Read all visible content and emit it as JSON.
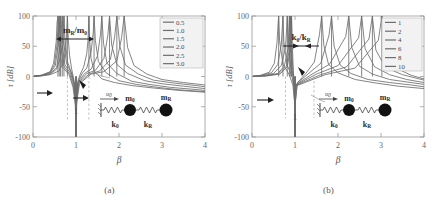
{
  "figure": {
    "panels": [
      {
        "caption": "(a)",
        "annotation": "mR/m0",
        "annotation_parts": {
          "num": "m",
          "num_sub": "R",
          "den": "m",
          "den_sub": "0",
          "slash": "/"
        },
        "one_marker": "1",
        "legend_title": "",
        "legend_entries": [
          "0.5",
          "1.0",
          "1.5",
          "2.0",
          "2.5",
          "3.0"
        ],
        "diagram": {
          "u0": "u",
          "u0_sub": "0",
          "mass_left": "m",
          "mass_left_sub": "0",
          "mass_right": "m",
          "mass_right_sub": "R",
          "spring_left": "k",
          "spring_left_sub": "0",
          "spring_right": "k",
          "spring_right_sub": "R"
        }
      },
      {
        "caption": "(b)",
        "annotation": "k0/kR",
        "annotation_parts": {
          "num": "k",
          "num_sub": "0",
          "den": "k",
          "den_sub": "R",
          "slash": "/"
        },
        "one_marker": "1",
        "legend_title": "",
        "legend_entries": [
          "1",
          "2",
          "4",
          "6",
          "8",
          "10"
        ],
        "diagram": {
          "u0": "u",
          "u0_sub": "0",
          "mass_left": "m",
          "mass_left_sub": "0",
          "mass_right": "m",
          "mass_right_sub": "R",
          "spring_left": "k",
          "spring_left_sub": "0",
          "spring_right": "k",
          "spring_right_sub": "R"
        }
      }
    ]
  },
  "chart_data": [
    {
      "type": "line",
      "title": "(a)",
      "xlabel": "β",
      "ylabel": "τ [dB]",
      "xlim": [
        0,
        4
      ],
      "ylim": [
        -100,
        100
      ],
      "xticks": [
        0,
        1,
        2,
        3,
        4
      ],
      "yticks": [
        -100,
        -50,
        0,
        50,
        100
      ],
      "xtick_labels": [
        "0",
        "1",
        "2",
        "3",
        "4"
      ],
      "ytick_labels": [
        "-100",
        "-50",
        "0",
        "50",
        "100"
      ],
      "grid": false,
      "legend_position": "upper-right",
      "legend_parameter": "mR/m0",
      "series": [
        {
          "name": "0.5",
          "color": "#6e6e6e",
          "resonances": [
            0.8,
            1.3
          ],
          "antiresonance": 1.0,
          "x": [
            0.02,
            0.2,
            0.4,
            0.6,
            0.7,
            0.75,
            0.78,
            0.8,
            0.82,
            0.85,
            0.9,
            0.95,
            0.98,
            1.0,
            1.02,
            1.05,
            1.1,
            1.18,
            1.25,
            1.28,
            1.3,
            1.32,
            1.35,
            1.42,
            1.6,
            1.9,
            2.3,
            2.8,
            3.4,
            4.0
          ],
          "y": [
            0.2,
            1.0,
            3.0,
            9.0,
            22.0,
            40.0,
            65.0,
            100.0,
            62.0,
            35.0,
            12.0,
            -5.0,
            -25.0,
            -100.0,
            -24.0,
            -6.0,
            4.0,
            16.0,
            38.0,
            60.0,
            100.0,
            58.0,
            30.0,
            9.0,
            -4.0,
            -10.0,
            -15.0,
            -19.0,
            -23.0,
            -26.0
          ]
        },
        {
          "name": "1.0",
          "color": "#6e6e6e",
          "resonances": [
            0.72,
            1.42
          ],
          "antiresonance": 1.0,
          "x": [
            0.02,
            0.2,
            0.4,
            0.55,
            0.65,
            0.7,
            0.72,
            0.74,
            0.8,
            0.9,
            0.95,
            0.98,
            1.0,
            1.02,
            1.05,
            1.15,
            1.25,
            1.35,
            1.4,
            1.42,
            1.45,
            1.52,
            1.7,
            2.0,
            2.4,
            2.9,
            3.4,
            4.0
          ],
          "y": [
            0.3,
            1.2,
            4.0,
            12.0,
            35.0,
            70.0,
            100.0,
            66.0,
            25.0,
            5.0,
            -8.0,
            -28.0,
            -100.0,
            -27.0,
            -8.0,
            6.0,
            14.0,
            40.0,
            72.0,
            100.0,
            60.0,
            25.0,
            6.0,
            -7.0,
            -13.0,
            -18.0,
            -22.0,
            -25.0
          ]
        },
        {
          "name": "1.5",
          "color": "#6e6e6e",
          "resonances": [
            0.68,
            1.6
          ],
          "antiresonance": 1.0,
          "x": [
            0.02,
            0.2,
            0.4,
            0.55,
            0.62,
            0.66,
            0.68,
            0.7,
            0.78,
            0.9,
            0.96,
            0.99,
            1.0,
            1.01,
            1.05,
            1.2,
            1.35,
            1.5,
            1.57,
            1.6,
            1.64,
            1.72,
            1.95,
            2.3,
            2.7,
            3.2,
            3.7,
            4.0
          ],
          "y": [
            0.4,
            1.5,
            5.0,
            15.0,
            45.0,
            80.0,
            100.0,
            62.0,
            22.0,
            4.0,
            -12.0,
            -35.0,
            -100.0,
            -34.0,
            -9.0,
            5.0,
            12.0,
            34.0,
            70.0,
            100.0,
            55.0,
            22.0,
            5.0,
            -8.0,
            -13.0,
            -18.0,
            -21.0,
            -23.0
          ]
        },
        {
          "name": "2.0",
          "color": "#6e6e6e",
          "resonances": [
            0.64,
            1.78
          ],
          "antiresonance": 1.0,
          "x": [
            0.02,
            0.2,
            0.4,
            0.52,
            0.58,
            0.62,
            0.64,
            0.66,
            0.74,
            0.88,
            0.95,
            0.99,
            1.0,
            1.01,
            1.06,
            1.25,
            1.45,
            1.65,
            1.74,
            1.78,
            1.83,
            1.95,
            2.2,
            2.6,
            3.0,
            3.5,
            4.0
          ],
          "y": [
            0.5,
            1.8,
            6.0,
            18.0,
            50.0,
            85.0,
            100.0,
            60.0,
            20.0,
            4.0,
            -14.0,
            -40.0,
            -100.0,
            -38.0,
            -10.0,
            5.0,
            10.0,
            30.0,
            68.0,
            100.0,
            52.0,
            20.0,
            5.0,
            -7.0,
            -12.0,
            -16.0,
            -20.0
          ]
        },
        {
          "name": "2.5",
          "color": "#6e6e6e",
          "resonances": [
            0.61,
            1.95
          ],
          "antiresonance": 1.0,
          "x": [
            0.02,
            0.2,
            0.4,
            0.5,
            0.56,
            0.59,
            0.61,
            0.63,
            0.71,
            0.86,
            0.94,
            0.99,
            1.0,
            1.01,
            1.07,
            1.3,
            1.55,
            1.8,
            1.9,
            1.95,
            2.02,
            2.15,
            2.45,
            2.8,
            3.3,
            3.8,
            4.0
          ],
          "y": [
            0.6,
            2.0,
            7.0,
            20.0,
            54.0,
            88.0,
            100.0,
            58.0,
            18.0,
            3.0,
            -16.0,
            -44.0,
            -100.0,
            -42.0,
            -11.0,
            4.0,
            9.0,
            28.0,
            66.0,
            100.0,
            50.0,
            19.0,
            4.0,
            -6.0,
            -11.0,
            -15.0,
            -17.0
          ]
        },
        {
          "name": "3.0",
          "color": "#6e6e6e",
          "resonances": [
            0.58,
            2.12
          ],
          "antiresonance": 1.0,
          "x": [
            0.02,
            0.2,
            0.4,
            0.48,
            0.54,
            0.56,
            0.58,
            0.6,
            0.68,
            0.84,
            0.93,
            0.99,
            1.0,
            1.01,
            1.08,
            1.35,
            1.65,
            1.95,
            2.06,
            2.12,
            2.2,
            2.35,
            2.65,
            3.0,
            3.5,
            4.0
          ],
          "y": [
            0.7,
            2.2,
            8.0,
            22.0,
            58.0,
            90.0,
            100.0,
            56.0,
            16.0,
            3.0,
            -18.0,
            -48.0,
            -100.0,
            -46.0,
            -12.0,
            4.0,
            8.0,
            26.0,
            64.0,
            100.0,
            48.0,
            18.0,
            4.0,
            -5.0,
            -10.0,
            -14.0
          ]
        }
      ],
      "annotations": [
        {
          "text": "mR/m0",
          "type": "double-arrow",
          "x_from": 0.8,
          "x_to": 1.3,
          "y": 78
        },
        {
          "text": "1",
          "type": "x-marker",
          "x": 1.0,
          "y": -60
        },
        {
          "text": "",
          "type": "arrow-left",
          "x": 0.62,
          "y": -42
        },
        {
          "text": "",
          "type": "arrow-right",
          "x": 1.3,
          "y": -42
        }
      ]
    },
    {
      "type": "line",
      "title": "(b)",
      "xlabel": "β",
      "ylabel": "τ [dB]",
      "xlim": [
        0,
        4
      ],
      "ylim": [
        -100,
        100
      ],
      "xticks": [
        0,
        1,
        2,
        3,
        4
      ],
      "yticks": [
        -100,
        -50,
        0,
        50,
        100
      ],
      "xtick_labels": [
        "0",
        "1",
        "2",
        "3",
        "4"
      ],
      "ytick_labels": [
        "-100",
        "-50",
        "0",
        "50",
        "100"
      ],
      "grid": false,
      "legend_position": "upper-right",
      "legend_parameter": "k0/kR",
      "series": [
        {
          "name": "1",
          "color": "#6e6e6e",
          "resonances": [
            0.62,
            1.62
          ],
          "antiresonance": 1.0,
          "x": [
            0.02,
            0.2,
            0.4,
            0.52,
            0.58,
            0.61,
            0.62,
            0.64,
            0.72,
            0.86,
            0.95,
            0.99,
            1.0,
            1.01,
            1.06,
            1.25,
            1.45,
            1.57,
            1.62,
            1.67,
            1.78,
            2.0,
            2.4,
            2.9,
            3.4,
            4.0
          ],
          "y": [
            0.5,
            2.0,
            7.0,
            22.0,
            55.0,
            90.0,
            100.0,
            60.0,
            20.0,
            4.0,
            -14.0,
            -40.0,
            -100.0,
            -38.0,
            -10.0,
            5.0,
            24.0,
            70.0,
            100.0,
            52.0,
            20.0,
            6.0,
            -5.0,
            -11.0,
            -16.0,
            -20.0
          ]
        },
        {
          "name": "2",
          "color": "#6e6e6e",
          "resonances": [
            0.72,
            1.85
          ],
          "antiresonance": 1.0,
          "x": [
            0.02,
            0.2,
            0.45,
            0.6,
            0.68,
            0.71,
            0.72,
            0.74,
            0.82,
            0.92,
            0.97,
            0.99,
            1.0,
            1.01,
            1.05,
            1.3,
            1.6,
            1.79,
            1.85,
            1.91,
            2.05,
            2.3,
            2.7,
            3.2,
            3.7,
            4.0
          ],
          "y": [
            0.4,
            1.6,
            6.0,
            20.0,
            52.0,
            88.0,
            100.0,
            58.0,
            18.0,
            3.0,
            -16.0,
            -45.0,
            -100.0,
            -42.0,
            -11.0,
            4.0,
            22.0,
            68.0,
            100.0,
            50.0,
            19.0,
            5.0,
            -5.0,
            -10.0,
            -14.0,
            -17.0
          ]
        },
        {
          "name": "4",
          "color": "#6e6e6e",
          "resonances": [
            0.82,
            2.25
          ],
          "antiresonance": 1.0,
          "x": [
            0.02,
            0.25,
            0.5,
            0.68,
            0.78,
            0.81,
            0.82,
            0.84,
            0.9,
            0.95,
            0.98,
            0.995,
            1.0,
            1.005,
            1.03,
            1.4,
            1.8,
            2.18,
            2.25,
            2.32,
            2.5,
            2.8,
            3.2,
            3.7,
            4.0
          ],
          "y": [
            0.3,
            1.3,
            5.0,
            18.0,
            48.0,
            85.0,
            100.0,
            56.0,
            16.0,
            0.0,
            -20.0,
            -55.0,
            -100.0,
            -50.0,
            -13.0,
            4.0,
            20.0,
            66.0,
            100.0,
            48.0,
            17.0,
            4.0,
            -5.0,
            -10.0,
            -13.0
          ]
        },
        {
          "name": "6",
          "color": "#6e6e6e",
          "resonances": [
            0.87,
            2.55
          ],
          "antiresonance": 1.0,
          "x": [
            0.02,
            0.3,
            0.6,
            0.75,
            0.84,
            0.86,
            0.87,
            0.89,
            0.93,
            0.97,
            0.99,
            0.998,
            1.0,
            1.002,
            1.02,
            1.5,
            2.0,
            2.48,
            2.55,
            2.63,
            2.85,
            3.2,
            3.6,
            4.0
          ],
          "y": [
            0.25,
            1.1,
            5.0,
            17.0,
            46.0,
            84.0,
            100.0,
            54.0,
            14.0,
            -5.0,
            -28.0,
            -62.0,
            -100.0,
            -56.0,
            -14.0,
            4.0,
            18.0,
            64.0,
            100.0,
            46.0,
            16.0,
            3.0,
            -5.0,
            -10.0
          ]
        },
        {
          "name": "8",
          "color": "#6e6e6e",
          "resonances": [
            0.9,
            2.8
          ],
          "antiresonance": 1.0,
          "x": [
            0.02,
            0.3,
            0.62,
            0.8,
            0.87,
            0.89,
            0.9,
            0.92,
            0.95,
            0.98,
            0.995,
            0.999,
            1.0,
            1.001,
            1.015,
            1.6,
            2.2,
            2.72,
            2.8,
            2.88,
            3.1,
            3.5,
            4.0
          ],
          "y": [
            0.2,
            1.0,
            4.5,
            17.0,
            45.0,
            82.0,
            100.0,
            52.0,
            12.0,
            -10.0,
            -35.0,
            -68.0,
            -100.0,
            -62.0,
            -15.0,
            3.0,
            16.0,
            62.0,
            100.0,
            44.0,
            15.0,
            3.0,
            -6.0
          ]
        },
        {
          "name": "10",
          "color": "#6e6e6e",
          "resonances": [
            0.92,
            3.02
          ],
          "antiresonance": 1.0,
          "x": [
            0.02,
            0.35,
            0.65,
            0.82,
            0.89,
            0.91,
            0.92,
            0.94,
            0.96,
            0.985,
            0.997,
            0.9995,
            1.0,
            1.0005,
            1.012,
            1.7,
            2.4,
            2.94,
            3.02,
            3.1,
            3.35,
            3.7,
            4.0
          ],
          "y": [
            0.2,
            0.9,
            4.0,
            16.0,
            44.0,
            80.0,
            100.0,
            50.0,
            10.0,
            -14.0,
            -42.0,
            -72.0,
            -100.0,
            -66.0,
            -16.0,
            3.0,
            14.0,
            60.0,
            100.0,
            42.0,
            14.0,
            2.0,
            -4.0
          ]
        }
      ],
      "annotations": [
        {
          "text": "k0/kR",
          "type": "double-arrow",
          "x_from": 0.78,
          "x_to": 1.45,
          "y": 72
        },
        {
          "text": "1",
          "type": "x-marker",
          "x": 1.0,
          "y": -60
        },
        {
          "text": "",
          "type": "arrow-right",
          "x": 0.78,
          "y": -38
        }
      ]
    }
  ]
}
